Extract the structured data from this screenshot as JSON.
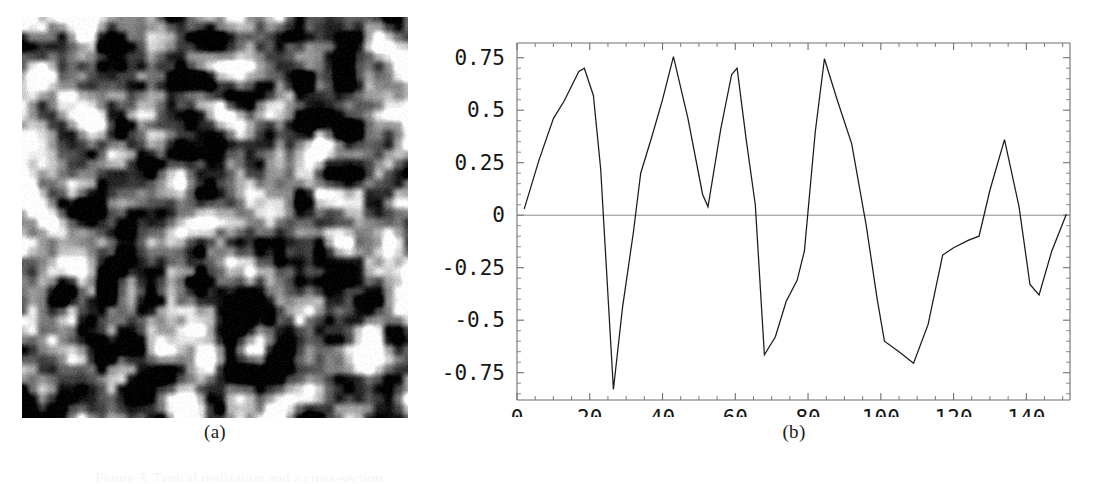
{
  "figure": {
    "panel_a": {
      "caption": "(a)",
      "kind": "grayscale-texture-image",
      "description": "Random blurred grayscale texture field",
      "width_px": 386,
      "height_px": 401,
      "background_hex": "#808080",
      "min_gray_hex": "#000000",
      "max_gray_hex": "#ffffff"
    },
    "panel_b": {
      "caption": "(b)"
    },
    "bottom_caption_fragment": "Figure 3.  Typical realization and a cross-section"
  },
  "chart_data": {
    "type": "line",
    "title": "",
    "xlabel": "",
    "ylabel": "",
    "xlim": [
      0,
      152
    ],
    "ylim": [
      -0.88,
      0.82
    ],
    "grid": false,
    "legend": false,
    "line_color": "#1a1a1a",
    "zero_line_color": "#8a8a8a",
    "frame_color": "#6e6e6e",
    "xticks": [
      0,
      20,
      40,
      60,
      80,
      100,
      120,
      140
    ],
    "xtick_labels": [
      "0",
      "20",
      "40",
      "60",
      "80",
      "100",
      "120",
      "140"
    ],
    "yticks": [
      -0.75,
      -0.5,
      -0.25,
      0,
      0.25,
      0.5,
      0.75
    ],
    "ytick_labels": [
      "-0.75",
      "-0.5",
      "-0.25",
      "0",
      "0.25",
      "0.5",
      "0.75"
    ],
    "x_minor_tick_step": 5,
    "y_minor_tick_step": 0.05,
    "series": [
      {
        "name": "cross-section",
        "x": [
          2,
          6,
          10,
          13,
          17,
          18.5,
          21,
          23,
          26.5,
          29,
          32,
          34,
          37,
          40,
          43,
          47,
          51,
          52.5,
          56,
          59,
          60.5,
          63,
          65.5,
          68,
          71,
          74,
          77,
          79,
          82,
          84.5,
          88,
          92,
          96,
          99,
          101,
          105,
          109,
          113,
          117,
          120,
          124,
          127,
          130,
          134,
          138,
          141,
          143.5,
          147,
          151
        ],
        "y": [
          0.03,
          0.26,
          0.46,
          0.545,
          0.685,
          0.7,
          0.57,
          0.22,
          -0.83,
          -0.44,
          -0.08,
          0.2,
          0.37,
          0.55,
          0.755,
          0.46,
          0.1,
          0.04,
          0.41,
          0.67,
          0.7,
          0.36,
          0.05,
          -0.665,
          -0.58,
          -0.41,
          -0.31,
          -0.17,
          0.4,
          0.745,
          0.55,
          0.34,
          -0.05,
          -0.4,
          -0.6,
          -0.65,
          -0.705,
          -0.52,
          -0.19,
          -0.155,
          -0.12,
          -0.1,
          0.12,
          0.36,
          0.04,
          -0.33,
          -0.38,
          -0.17,
          0.005
        ]
      }
    ]
  }
}
